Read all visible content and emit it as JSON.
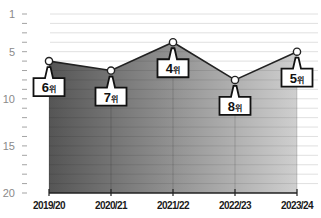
{
  "chart_data": {
    "type": "area",
    "title": "",
    "xlabel": "",
    "ylabel": "",
    "categories": [
      "2019/20",
      "2020/21",
      "2021/22",
      "2022/23",
      "2023/24"
    ],
    "series": [
      {
        "name": "순위",
        "values": [
          6,
          7,
          4,
          8,
          5
        ]
      }
    ],
    "data_labels": [
      "6위",
      "7위",
      "4위",
      "8위",
      "5위"
    ],
    "label_unit": "위",
    "y_axis": {
      "inverted": true,
      "ylim": [
        1,
        20
      ],
      "tick_labels": [
        "1",
        "5",
        "10",
        "15",
        "20"
      ],
      "minor_ticks_every": 1
    },
    "grid": true,
    "legend": "none",
    "colors": {
      "fill_left": "#555555",
      "fill_right": "#cfcfcf",
      "line": "#222222",
      "marker_fill": "#ffffff",
      "gridline": "#d8d8d8",
      "axis": "#222222",
      "tick_label": "#8a8a8a"
    }
  }
}
